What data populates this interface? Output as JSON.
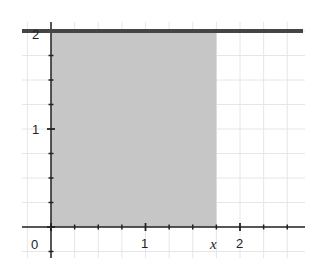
{
  "chart_data": {
    "type": "area",
    "title": "",
    "xlabel": "",
    "ylabel": "",
    "function": "y = 2 (constant)",
    "series": [
      {
        "name": "y = 2",
        "x": [
          -0.3,
          2.7
        ],
        "y": [
          2,
          2
        ],
        "style": "thick dark line"
      }
    ],
    "shaded_region": {
      "x_from": 0,
      "x_to": 1.75,
      "y_from": 0,
      "y_to": 2,
      "label": "area under y=2 from 0 to x"
    },
    "xlim": [
      -0.35,
      2.7
    ],
    "ylim": [
      -0.3,
      2.1
    ],
    "x_ticks": [
      0,
      0.25,
      0.5,
      0.75,
      1,
      1.25,
      1.5,
      1.75,
      2,
      2.25,
      2.5
    ],
    "y_ticks": [
      0,
      0.25,
      0.5,
      0.75,
      1,
      1.25,
      1.5,
      1.75,
      2
    ],
    "x_tick_labels": [
      {
        "value": 0,
        "text": "0"
      },
      {
        "value": 1,
        "text": "1"
      },
      {
        "value": 2,
        "text": "2"
      }
    ],
    "y_tick_labels": [
      {
        "value": 1,
        "text": "1"
      },
      {
        "value": 2,
        "text": "2"
      }
    ],
    "annotations": [
      {
        "text": "x",
        "at_x": 1.75,
        "style": "italic",
        "position": "below x-axis"
      }
    ],
    "grid": true
  },
  "colors": {
    "shade": "#c6c6c6",
    "line": "#454545",
    "axis": "#222222",
    "grid": "#e6e6e6"
  },
  "labels": {
    "origin": "0",
    "x1": "1",
    "x2": "2",
    "xvar": "x",
    "y1": "1",
    "y2": "2"
  }
}
